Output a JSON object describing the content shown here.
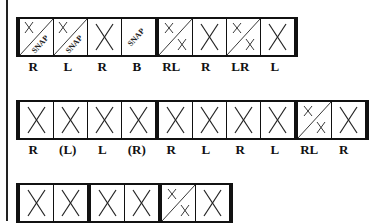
{
  "rows": [
    {
      "cells": [
        {
          "type": "x-snap",
          "label": "R"
        },
        {
          "type": "x-snap",
          "label": "L"
        },
        {
          "type": "x",
          "label": "R"
        },
        {
          "type": "snap",
          "label": "B"
        },
        {
          "type": "split-xx",
          "label": "RL"
        },
        {
          "type": "x",
          "label": "R"
        },
        {
          "type": "split-xx",
          "label": "LR"
        },
        {
          "type": "x",
          "label": "L"
        }
      ],
      "bars_after": [
        3,
        7
      ]
    },
    {
      "cells": [
        {
          "type": "x",
          "label": "R"
        },
        {
          "type": "x",
          "label": "(L)"
        },
        {
          "type": "x",
          "label": "L"
        },
        {
          "type": "x",
          "label": "(R)"
        },
        {
          "type": "x",
          "label": "R"
        },
        {
          "type": "x",
          "label": "L"
        },
        {
          "type": "x",
          "label": "R"
        },
        {
          "type": "x",
          "label": "L"
        },
        {
          "type": "split-xx",
          "label": "RL"
        },
        {
          "type": "x",
          "label": "R"
        }
      ],
      "bars_after": [
        3,
        7,
        9
      ]
    },
    {
      "cells": [
        {
          "type": "x",
          "label": ""
        },
        {
          "type": "x",
          "label": ""
        },
        {
          "type": "x",
          "label": ""
        },
        {
          "type": "x",
          "label": ""
        },
        {
          "type": "split-xx",
          "label": ""
        },
        {
          "type": "x",
          "label": ""
        }
      ],
      "bars_after": [
        1,
        3,
        5
      ]
    }
  ],
  "snap_text": "SNAP",
  "x_glyph": "X"
}
